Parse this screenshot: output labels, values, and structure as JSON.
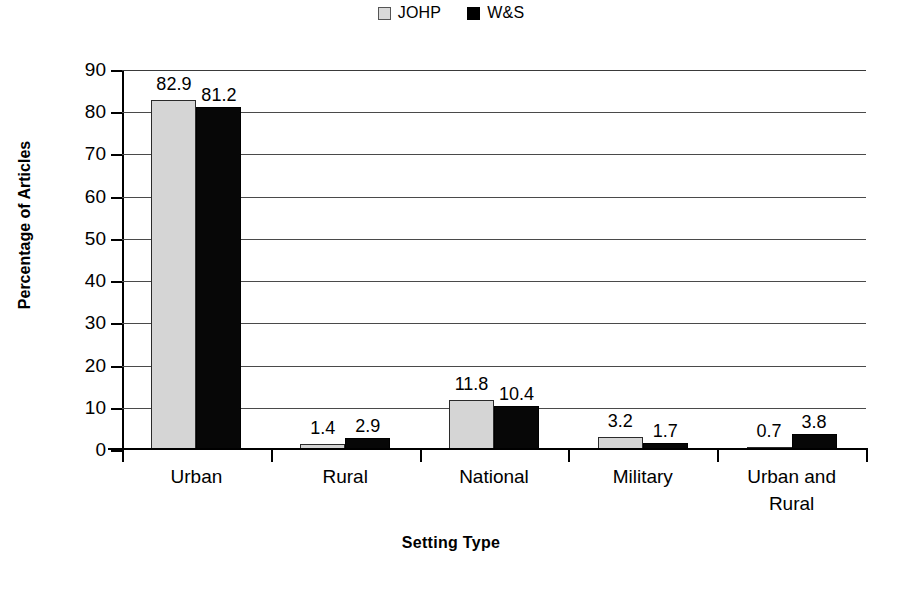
{
  "chart_data": {
    "type": "bar",
    "title": "",
    "xlabel": "Setting Type",
    "ylabel": "Percentage of Articles",
    "categories": [
      "Urban",
      "Rural",
      "National",
      "Military",
      "Urban and\nRural"
    ],
    "series": [
      {
        "name": "JOHP",
        "color": "#d5d5d5",
        "values": [
          82.9,
          1.4,
          11.8,
          3.2,
          0.7
        ]
      },
      {
        "name": "W&S",
        "color": "#070707",
        "values": [
          81.2,
          2.9,
          10.4,
          1.7,
          3.8
        ]
      }
    ],
    "ylim": [
      0,
      90
    ],
    "ytick_step": 10,
    "yticks": [
      0,
      10,
      20,
      30,
      40,
      50,
      60,
      70,
      80,
      90
    ],
    "ytick_labels": [
      "0",
      "10",
      "20",
      "30",
      "40",
      "50",
      "60",
      "70",
      "80",
      "90"
    ],
    "grid": true,
    "grid_axis": "y",
    "legend_position": "top-center",
    "data_labels": true
  },
  "legend": {
    "items": [
      {
        "label": "JOHP",
        "swatch": "light-gray-patterned-square"
      },
      {
        "label": "W&S",
        "swatch": "black-square"
      }
    ]
  },
  "axis": {
    "x_title": "Setting Type",
    "y_title": "Percentage of Articles"
  }
}
